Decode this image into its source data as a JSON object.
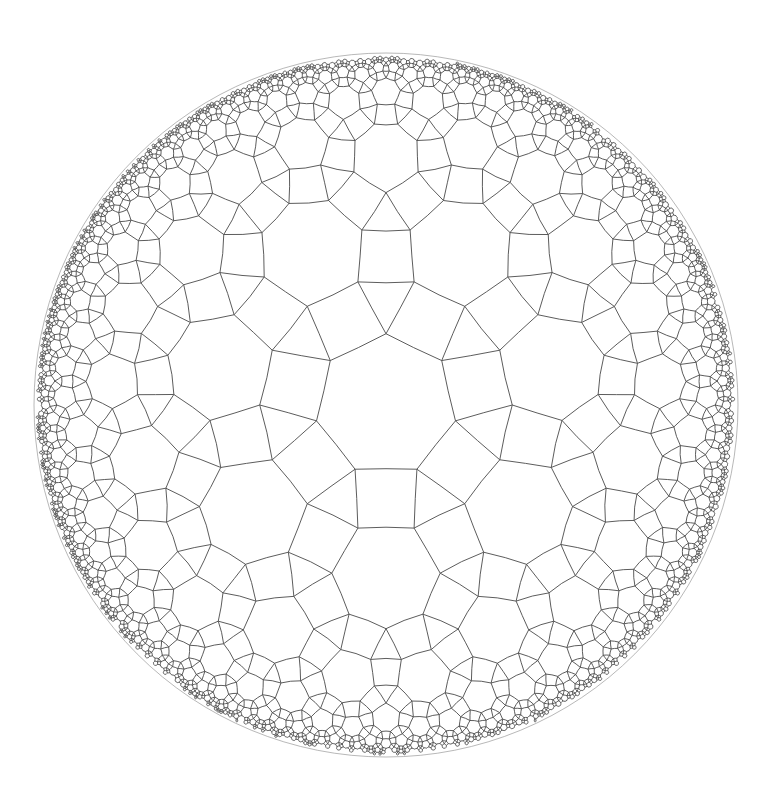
{
  "diagram": {
    "tiling": {
      "vertex_configuration": "3.4.7.4",
      "schlafli_base": [
        7,
        3
      ],
      "faces": [
        "heptagon",
        "square",
        "triangle"
      ],
      "center_face": "heptagon",
      "center_orientation": "vertex-up"
    },
    "disk": {
      "center_x": 386,
      "center_y": 405,
      "radius_px": 352
    },
    "style": {
      "background": "#ffffff",
      "line_color": "#4a4a4a",
      "line_width": 0.9,
      "boundary_color": "#888888"
    },
    "render": {
      "min_edge_px": 1.2,
      "max_tiles": 9000
    }
  }
}
